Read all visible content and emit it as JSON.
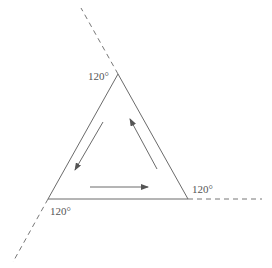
{
  "diagram": {
    "colors": {
      "stroke": "#6b6b6b",
      "dashed": "#777777",
      "text": "#555555"
    },
    "triangle": {
      "vertices": {
        "top": [
          118,
          74
        ],
        "bottom_left": [
          48,
          199
        ],
        "bottom_right": [
          188,
          199
        ]
      }
    },
    "extensions": [
      {
        "name": "top-extension",
        "from": [
          118,
          74
        ],
        "to": [
          81,
          8
        ]
      },
      {
        "name": "bottom-left-extension",
        "from": [
          48,
          199
        ],
        "to": [
          13,
          262
        ]
      },
      {
        "name": "bottom-right-extension",
        "from": [
          188,
          199
        ],
        "to": [
          262,
          199
        ]
      }
    ],
    "arrows": [
      {
        "name": "arrow-left-side-down",
        "from": [
          103,
          122
        ],
        "to": [
          75,
          170
        ]
      },
      {
        "name": "arrow-bottom-right",
        "from": [
          90,
          187
        ],
        "to": [
          148,
          187
        ]
      },
      {
        "name": "arrow-right-side-up",
        "from": [
          157,
          169
        ],
        "to": [
          130,
          119
        ]
      }
    ],
    "labels": [
      {
        "name": "angle-label-top",
        "text": "120°",
        "x": 88,
        "y": 71
      },
      {
        "name": "angle-label-bottom-left",
        "text": "120°",
        "x": 50,
        "y": 206
      },
      {
        "name": "angle-label-bottom-right",
        "text": "120°",
        "x": 192,
        "y": 184
      }
    ]
  }
}
